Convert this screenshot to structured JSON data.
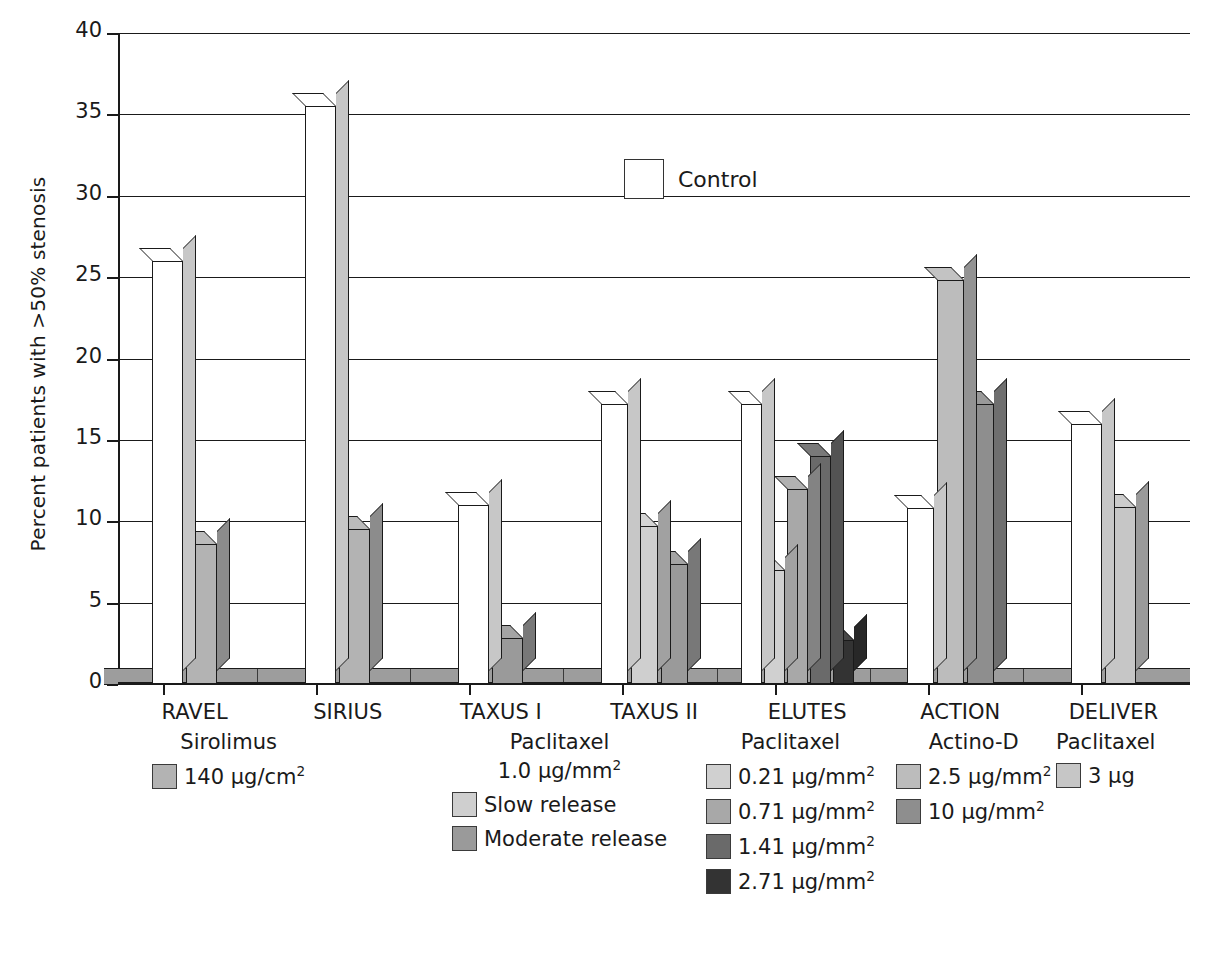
{
  "chart_data": {
    "type": "bar",
    "title": "",
    "xlabel": "",
    "ylabel": "Percent patients with >50% stenosis",
    "ylim": [
      0,
      40
    ],
    "ytick_values": [
      0,
      5,
      10,
      15,
      20,
      25,
      30,
      35,
      40
    ],
    "grid": true,
    "legend_position": "inside-top-center and below-axis",
    "categories": [
      "RAVEL",
      "SIRIUS",
      "TAXUS I",
      "TAXUS II",
      "ELUTES",
      "ACTION",
      "DELIVER"
    ],
    "series": [
      {
        "name": "Control",
        "color": "#ffffff",
        "values": [
          26.0,
          35.5,
          11.0,
          17.2,
          17.2,
          10.8,
          16.0
        ]
      },
      {
        "name": "Sirolimus 140 µg/cm²",
        "color": "#b3b3b3",
        "values": [
          8.6,
          null,
          null,
          null,
          null,
          null,
          null
        ]
      },
      {
        "name": "Paclitaxel 1.0 µg/mm² (SIRIUS sirolimus)",
        "color": "#b3b3b3",
        "values": [
          null,
          9.5,
          null,
          null,
          null,
          null,
          null
        ]
      },
      {
        "name": "Slow release",
        "color": "#cfcfcf",
        "values": [
          null,
          null,
          null,
          9.7,
          null,
          null,
          null
        ]
      },
      {
        "name": "Moderate release",
        "color": "#9a9a9a",
        "values": [
          null,
          null,
          2.8,
          7.4,
          null,
          null,
          null
        ]
      },
      {
        "name": "0.21 µg/mm²",
        "color": "#d0d0d0",
        "values": [
          null,
          null,
          null,
          null,
          7.0,
          null,
          null
        ]
      },
      {
        "name": "0.71 µg/mm²",
        "color": "#a8a8a8",
        "values": [
          null,
          null,
          null,
          null,
          12.0,
          null,
          null
        ]
      },
      {
        "name": "1.41 µg/mm²",
        "color": "#6a6a6a",
        "values": [
          null,
          null,
          null,
          null,
          14.0,
          null,
          null
        ]
      },
      {
        "name": "2.71 µg/mm²",
        "color": "#333333",
        "values": [
          null,
          null,
          null,
          null,
          2.7,
          null,
          null
        ]
      },
      {
        "name": "2.5 µg/mm²",
        "color": "#bcbcbc",
        "values": [
          null,
          null,
          null,
          null,
          null,
          24.8,
          null
        ]
      },
      {
        "name": "10 µg/mm²",
        "color": "#8e8e8e",
        "values": [
          null,
          null,
          null,
          null,
          null,
          17.2,
          null
        ]
      },
      {
        "name": "3 µg",
        "color": "#c6c6c6",
        "values": [
          null,
          null,
          null,
          null,
          null,
          null,
          10.9
        ]
      }
    ],
    "bars": [
      {
        "category": "RAVEL",
        "series": "Control",
        "value": 26.0,
        "color": "#ffffff"
      },
      {
        "category": "RAVEL",
        "series": "140 µg/cm²",
        "value": 8.6,
        "color": "#b3b3b3"
      },
      {
        "category": "SIRIUS",
        "series": "Control",
        "value": 35.5,
        "color": "#ffffff"
      },
      {
        "category": "SIRIUS",
        "series": "140 µg/cm²",
        "value": 9.5,
        "color": "#b3b3b3"
      },
      {
        "category": "TAXUS I",
        "series": "Control",
        "value": 11.0,
        "color": "#ffffff"
      },
      {
        "category": "TAXUS I",
        "series": "Moderate release",
        "value": 2.8,
        "color": "#9a9a9a"
      },
      {
        "category": "TAXUS II",
        "series": "Control",
        "value": 17.2,
        "color": "#ffffff"
      },
      {
        "category": "TAXUS II",
        "series": "Slow release",
        "value": 9.7,
        "color": "#cfcfcf"
      },
      {
        "category": "TAXUS II",
        "series": "Moderate release",
        "value": 7.4,
        "color": "#9a9a9a"
      },
      {
        "category": "ELUTES",
        "series": "Control",
        "value": 17.2,
        "color": "#ffffff"
      },
      {
        "category": "ELUTES",
        "series": "0.21 µg/mm²",
        "value": 7.0,
        "color": "#d0d0d0"
      },
      {
        "category": "ELUTES",
        "series": "0.71 µg/mm²",
        "value": 12.0,
        "color": "#a8a8a8"
      },
      {
        "category": "ELUTES",
        "series": "1.41 µg/mm²",
        "value": 14.0,
        "color": "#6a6a6a"
      },
      {
        "category": "ELUTES",
        "series": "2.71 µg/mm²",
        "value": 2.7,
        "color": "#333333"
      },
      {
        "category": "ACTION",
        "series": "Control",
        "value": 10.8,
        "color": "#ffffff"
      },
      {
        "category": "ACTION",
        "series": "2.5 µg/mm²",
        "value": 24.8,
        "color": "#bcbcbc"
      },
      {
        "category": "ACTION",
        "series": "10 µg/mm²",
        "value": 17.2,
        "color": "#8e8e8e"
      },
      {
        "category": "DELIVER",
        "series": "Control",
        "value": 16.0,
        "color": "#ffffff"
      },
      {
        "category": "DELIVER",
        "series": "3 µg",
        "value": 10.9,
        "color": "#c6c6c6"
      }
    ]
  },
  "axis": {
    "y_title": "Percent patients with >50% stenosis",
    "y_ticks": [
      "40",
      "35",
      "30",
      "25",
      "20",
      "15",
      "10",
      "5",
      "0"
    ]
  },
  "x_categories": [
    {
      "label": "RAVEL"
    },
    {
      "label": "SIRIUS"
    },
    {
      "label": "TAXUS I"
    },
    {
      "label": "TAXUS II"
    },
    {
      "label": "ELUTES"
    },
    {
      "label": "ACTION"
    },
    {
      "label": "DELIVER"
    }
  ],
  "control_legend": {
    "label": "Control",
    "color": "#ffffff"
  },
  "legend_groups": [
    {
      "id": "ravel",
      "title_line1": "Sirolimus",
      "rows": [
        {
          "swatch": "#b3b3b3",
          "text_main": "140  µg/cm",
          "sup": "2"
        }
      ]
    },
    {
      "id": "taxus",
      "title_line1": "Paclitaxel",
      "title_line2_main": "1.0  µg/mm",
      "title_line2_sup": "2",
      "rows": [
        {
          "swatch": "#cfcfcf",
          "text_main": "Slow release",
          "sup": ""
        },
        {
          "swatch": "#9a9a9a",
          "text_main": "Moderate release",
          "sup": ""
        }
      ]
    },
    {
      "id": "elutes",
      "title_line1": "Paclitaxel",
      "rows": [
        {
          "swatch": "#d0d0d0",
          "text_main": "0.21 µg/mm",
          "sup": "2"
        },
        {
          "swatch": "#a8a8a8",
          "text_main": "0.71 µg/mm",
          "sup": "2"
        },
        {
          "swatch": "#6a6a6a",
          "text_main": "1.41 µg/mm",
          "sup": "2"
        },
        {
          "swatch": "#333333",
          "text_main": "2.71 µg/mm",
          "sup": "2"
        }
      ]
    },
    {
      "id": "action",
      "title_line1": "Actino-D",
      "rows": [
        {
          "swatch": "#bcbcbc",
          "text_main": "2.5 µg/mm",
          "sup": "2"
        },
        {
          "swatch": "#8e8e8e",
          "text_main": "10 µg/mm",
          "sup": "2"
        }
      ]
    },
    {
      "id": "deliver",
      "title_line1": "Paclitaxel",
      "rows": [
        {
          "swatch": "#c6c6c6",
          "text_main": "3 µg",
          "sup": ""
        }
      ]
    }
  ],
  "colors": {
    "axis": "#1a1a1a",
    "floor": "#9d9d9d",
    "background": "#ffffff"
  }
}
